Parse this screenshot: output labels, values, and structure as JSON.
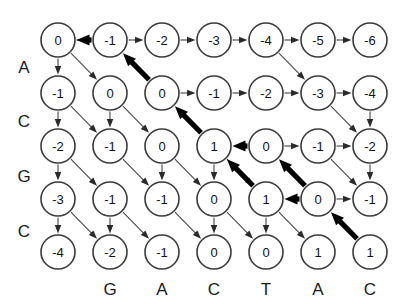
{
  "figure": {
    "type": "alignment-grid"
  },
  "grid": {
    "rows": 5,
    "cols": 7,
    "origin_x": 58,
    "origin_y": 40,
    "step_x": 52,
    "step_y": 53,
    "radius": 17,
    "values": [
      [
        "0",
        "-1",
        "-2",
        "-3",
        "-4",
        "-5",
        "-6"
      ],
      [
        "-1",
        "0",
        "0",
        "-1",
        "-2",
        "-3",
        "-4"
      ],
      [
        "-2",
        "-1",
        "0",
        "1",
        "0",
        "-1",
        "-2"
      ],
      [
        "-3",
        "-1",
        "-1",
        "0",
        "1",
        "0",
        "-1"
      ],
      [
        "-4",
        "-2",
        "-1",
        "0",
        "0",
        "1",
        "1"
      ]
    ]
  },
  "row_labels": {
    "sequence": [
      "A",
      "C",
      "G",
      "C"
    ],
    "x": 24,
    "ys": [
      67,
      121,
      176,
      231
    ]
  },
  "col_labels": {
    "sequence": [
      "G",
      "A",
      "C",
      "T",
      "A",
      "C"
    ],
    "y": 289,
    "xs": [
      110,
      162,
      214,
      266,
      318,
      370
    ]
  },
  "edges": {
    "thin": [
      {
        "from": [
          0,
          0
        ],
        "to": [
          0,
          1
        ],
        "dir": "right",
        "reversed": false
      },
      {
        "from": [
          0,
          1
        ],
        "to": [
          0,
          2
        ],
        "dir": "right",
        "reversed": false
      },
      {
        "from": [
          0,
          2
        ],
        "to": [
          0,
          3
        ],
        "dir": "right",
        "reversed": false
      },
      {
        "from": [
          0,
          3
        ],
        "to": [
          0,
          4
        ],
        "dir": "right",
        "reversed": false
      },
      {
        "from": [
          0,
          4
        ],
        "to": [
          0,
          5
        ],
        "dir": "right",
        "reversed": false
      },
      {
        "from": [
          0,
          5
        ],
        "to": [
          0,
          6
        ],
        "dir": "right",
        "reversed": false
      },
      {
        "from": [
          1,
          2
        ],
        "to": [
          1,
          3
        ],
        "dir": "right",
        "reversed": false
      },
      {
        "from": [
          1,
          3
        ],
        "to": [
          1,
          4
        ],
        "dir": "right",
        "reversed": false
      },
      {
        "from": [
          1,
          4
        ],
        "to": [
          1,
          5
        ],
        "dir": "right",
        "reversed": false
      },
      {
        "from": [
          1,
          5
        ],
        "to": [
          1,
          6
        ],
        "dir": "right",
        "reversed": false
      },
      {
        "from": [
          2,
          4
        ],
        "to": [
          2,
          5
        ],
        "dir": "right",
        "reversed": false
      },
      {
        "from": [
          2,
          5
        ],
        "to": [
          2,
          6
        ],
        "dir": "right",
        "reversed": false
      },
      {
        "from": [
          3,
          5
        ],
        "to": [
          3,
          6
        ],
        "dir": "right",
        "reversed": false
      },
      {
        "from": [
          0,
          0
        ],
        "to": [
          1,
          0
        ],
        "dir": "down",
        "reversed": false
      },
      {
        "from": [
          1,
          0
        ],
        "to": [
          2,
          0
        ],
        "dir": "down",
        "reversed": false
      },
      {
        "from": [
          2,
          0
        ],
        "to": [
          3,
          0
        ],
        "dir": "down",
        "reversed": false
      },
      {
        "from": [
          3,
          0
        ],
        "to": [
          4,
          0
        ],
        "dir": "down",
        "reversed": false
      },
      {
        "from": [
          1,
          1
        ],
        "to": [
          2,
          1
        ],
        "dir": "down",
        "reversed": false
      },
      {
        "from": [
          3,
          1
        ],
        "to": [
          4,
          1
        ],
        "dir": "down",
        "reversed": false
      },
      {
        "from": [
          2,
          2
        ],
        "to": [
          3,
          2
        ],
        "dir": "down",
        "reversed": false
      },
      {
        "from": [
          2,
          3
        ],
        "to": [
          3,
          3
        ],
        "dir": "down",
        "reversed": false
      },
      {
        "from": [
          3,
          3
        ],
        "to": [
          4,
          3
        ],
        "dir": "down",
        "reversed": false
      },
      {
        "from": [
          3,
          4
        ],
        "to": [
          4,
          4
        ],
        "dir": "down",
        "reversed": false
      },
      {
        "from": [
          0,
          0
        ],
        "to": [
          1,
          1
        ],
        "dir": "diag",
        "reversed": false
      },
      {
        "from": [
          1,
          0
        ],
        "to": [
          2,
          1
        ],
        "dir": "diag",
        "reversed": false
      },
      {
        "from": [
          1,
          1
        ],
        "to": [
          2,
          2
        ],
        "dir": "diag",
        "reversed": false
      },
      {
        "from": [
          2,
          0
        ],
        "to": [
          3,
          1
        ],
        "dir": "diag",
        "reversed": false
      },
      {
        "from": [
          2,
          1
        ],
        "to": [
          3,
          2
        ],
        "dir": "diag",
        "reversed": false
      },
      {
        "from": [
          2,
          2
        ],
        "to": [
          3,
          3
        ],
        "dir": "diag",
        "reversed": false
      },
      {
        "from": [
          2,
          3
        ],
        "to": [
          3,
          4
        ],
        "dir": "diag",
        "reversed": false
      },
      {
        "from": [
          3,
          0
        ],
        "to": [
          4,
          1
        ],
        "dir": "diag",
        "reversed": false
      },
      {
        "from": [
          3,
          1
        ],
        "to": [
          4,
          2
        ],
        "dir": "diag",
        "reversed": false
      },
      {
        "from": [
          3,
          2
        ],
        "to": [
          4,
          3
        ],
        "dir": "diag",
        "reversed": false
      },
      {
        "from": [
          3,
          3
        ],
        "to": [
          4,
          4
        ],
        "dir": "diag",
        "reversed": false
      },
      {
        "from": [
          3,
          4
        ],
        "to": [
          4,
          5
        ],
        "dir": "diag",
        "reversed": false
      },
      {
        "from": [
          0,
          4
        ],
        "to": [
          1,
          5
        ],
        "dir": "diag",
        "reversed": false
      },
      {
        "from": [
          1,
          5
        ],
        "to": [
          2,
          6
        ],
        "dir": "diag",
        "reversed": false
      },
      {
        "from": [
          2,
          6
        ],
        "to": [
          3,
          6
        ],
        "dir": "down",
        "reversed": false
      },
      {
        "from": [
          2,
          5
        ],
        "to": [
          3,
          6
        ],
        "dir": "diag",
        "reversed": false
      },
      {
        "from": [
          1,
          6
        ],
        "to": [
          2,
          6
        ],
        "dir": "diag-steep",
        "reversed": false
      }
    ],
    "bold": [
      {
        "from": [
          0,
          1
        ],
        "to": [
          0,
          0
        ],
        "dir": "left"
      },
      {
        "from": [
          1,
          2
        ],
        "to": [
          0,
          1
        ],
        "dir": "diag-up"
      },
      {
        "from": [
          2,
          3
        ],
        "to": [
          1,
          2
        ],
        "dir": "diag-up"
      },
      {
        "from": [
          2,
          4
        ],
        "to": [
          2,
          3
        ],
        "dir": "left"
      },
      {
        "from": [
          3,
          4
        ],
        "to": [
          2,
          3
        ],
        "dir": "diag-up"
      },
      {
        "from": [
          3,
          5
        ],
        "to": [
          2,
          4
        ],
        "dir": "diag-up"
      },
      {
        "from": [
          3,
          5
        ],
        "to": [
          3,
          4
        ],
        "dir": "left"
      },
      {
        "from": [
          4,
          6
        ],
        "to": [
          3,
          5
        ],
        "dir": "diag-up"
      }
    ]
  },
  "colors": {
    "node_fill": "#ffffff",
    "node_stroke": "#3b3b3b",
    "thin_edge": "#4a4a4a",
    "bold_edge": "#000000",
    "text": "#111111",
    "background": "#ffffff"
  }
}
